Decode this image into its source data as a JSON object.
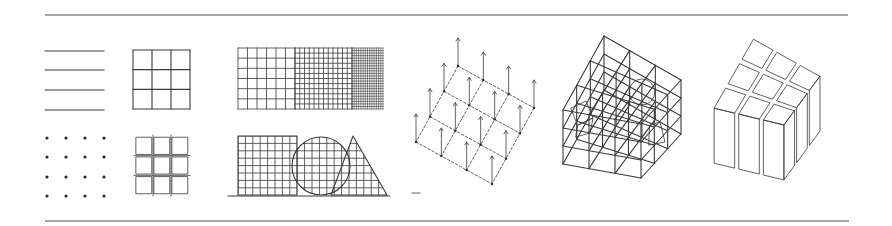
{
  "figure": {
    "colors": {
      "ink": "#3a3a3a",
      "background": "#ffffff",
      "rule": "#555555"
    },
    "rules": {
      "top": {
        "x1": 45,
        "x2": 848,
        "y": 15
      },
      "bottom": {
        "x1": 45,
        "x2": 849,
        "y": 221
      }
    },
    "panels": [
      {
        "id": "parallel-lines",
        "count": 4,
        "x1": 45,
        "x2": 104,
        "ys": [
          51,
          70,
          90,
          110
        ]
      },
      {
        "id": "point-grid",
        "rows": 4,
        "cols": 4,
        "xs": [
          47,
          66,
          85,
          104
        ],
        "ys": [
          138,
          157,
          177,
          196
        ]
      },
      {
        "id": "square-grid-3x3",
        "x": 133,
        "y": 50,
        "w": 57,
        "h": 59,
        "divisions": 3
      },
      {
        "id": "spaced-module-grid-3x3",
        "x": 135,
        "y": 136,
        "w": 54,
        "h": 59,
        "divisions": 3,
        "gap": 2.5
      },
      {
        "id": "variable-density-grid",
        "x": 238,
        "y": 48,
        "h": 61,
        "zones": [
          {
            "w": 57,
            "cols": 6,
            "rows": 6
          },
          {
            "w": 57,
            "cols": 12,
            "rows": 12
          },
          {
            "w": 31,
            "cols": 14,
            "rows": 24
          }
        ]
      },
      {
        "id": "shapes-on-grid",
        "square": {
          "x": 238,
          "y": 136,
          "w": 59,
          "h": 59
        },
        "circle": {
          "cx": 321,
          "cy": 166,
          "r": 29
        },
        "triangle": {
          "apex": [
            353,
            136
          ],
          "base_left": [
            331,
            195
          ],
          "base_right": [
            387,
            195
          ]
        },
        "baseline": {
          "x1": 228,
          "x2": 390,
          "y": 196
        },
        "cell": 7.4
      },
      {
        "id": "isometric-point-field",
        "corners": {
          "top": [
            458,
            66
          ],
          "right": [
            534,
            108
          ],
          "bottom": [
            492,
            184
          ],
          "left": [
            416,
            142
          ]
        },
        "points_per_side": 4,
        "arrow_height": 28
      },
      {
        "id": "wireframe-spatial-grid",
        "top_face": {
          "top": [
            604,
            36
          ],
          "right": [
            681,
            80
          ],
          "front": [
            641,
            124
          ],
          "left": [
            563,
            110
          ]
        },
        "height": 54,
        "divisions": 3
      },
      {
        "id": "solid-block-grid",
        "top_face": {
          "top": [
            753,
            36
          ],
          "right": [
            823,
            76
          ],
          "front": [
            785,
            127
          ],
          "left": [
            711,
            110
          ]
        },
        "height": 55,
        "divisions": 3
      }
    ]
  }
}
